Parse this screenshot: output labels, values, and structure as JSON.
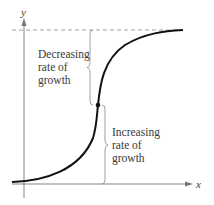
{
  "diagram": {
    "type": "logistic-growth-curve",
    "axes": {
      "x_label": "x",
      "y_label": "y"
    },
    "asymptote": "horizontal dashed line (upper bound)",
    "inflection_point": "marked with a dot",
    "annotations": {
      "upper": [
        "Decreasing",
        "rate of",
        "growth"
      ],
      "lower": [
        "Increasing",
        "rate of",
        "growth"
      ]
    },
    "colors": {
      "curve": "#111111",
      "axes": "#777777",
      "text": "#3a3a3a"
    }
  }
}
